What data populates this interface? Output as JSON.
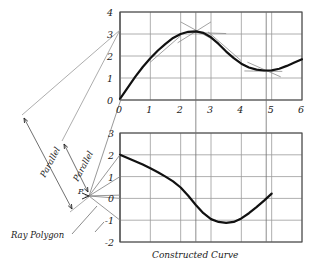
{
  "figure": {
    "caption": "Constructed Curve",
    "annotations": {
      "parallel_outer": "Parallel",
      "parallel_inner": "Parallel",
      "ray_polygon": "Ray Polygon",
      "pole": "P"
    }
  },
  "chart_data": [
    {
      "type": "line",
      "title": "",
      "id": "derivative-curve",
      "xlabel": "",
      "ylabel": "",
      "xlim": [
        0,
        6
      ],
      "ylim": [
        0,
        4
      ],
      "grid": true,
      "xticks": [
        "0",
        "1",
        "2",
        "3",
        "4",
        "5",
        "6"
      ],
      "yticks": [
        "0",
        "1",
        "2",
        "3",
        "4"
      ],
      "x": [
        0,
        0.25,
        0.5,
        0.75,
        1,
        1.25,
        1.5,
        1.75,
        2,
        2.25,
        2.5,
        2.75,
        3,
        3.25,
        3.5,
        3.75,
        4,
        4.25,
        4.5,
        4.75,
        5,
        5.25,
        5.5,
        5.75,
        6
      ],
      "values": [
        0.05,
        0.55,
        1.05,
        1.5,
        1.9,
        2.25,
        2.55,
        2.82,
        3.0,
        3.1,
        3.12,
        3.05,
        2.85,
        2.55,
        2.2,
        1.9,
        1.65,
        1.48,
        1.38,
        1.34,
        1.35,
        1.42,
        1.55,
        1.7,
        1.85
      ],
      "tangent_segments": [
        {
          "x0": 1.0,
          "y0": 1.72,
          "x1": 2.0,
          "y1": 2.92
        },
        {
          "x0": 1.9,
          "y0": 2.6,
          "x1": 3.0,
          "y1": 3.55
        },
        {
          "x0": 2.0,
          "y0": 3.55,
          "x1": 3.1,
          "y1": 2.72
        },
        {
          "x0": 2.2,
          "y0": 3.08,
          "x1": 3.5,
          "y1": 3.02
        },
        {
          "x0": 2.9,
          "y0": 3.1,
          "x1": 4.0,
          "y1": 1.78
        },
        {
          "x0": 4.1,
          "y0": 1.32,
          "x1": 5.35,
          "y1": 1.3
        },
        {
          "x0": 4.2,
          "y0": 1.72,
          "x1": 5.3,
          "y1": 1.05
        }
      ]
    },
    {
      "type": "line",
      "title": "",
      "id": "constructed-curve",
      "xlabel": "",
      "ylabel": "",
      "xlim": [
        0,
        6
      ],
      "ylim": [
        -2,
        3
      ],
      "grid": true,
      "xticks": [],
      "yticks": [
        "3",
        "2",
        "1",
        "0",
        "-1",
        "-2"
      ],
      "x": [
        0,
        0.25,
        0.5,
        0.75,
        1,
        1.25,
        1.5,
        1.75,
        2,
        2.25,
        2.5,
        2.75,
        3,
        3.25,
        3.5,
        3.75,
        4,
        4.25,
        4.5,
        4.75,
        5
      ],
      "values": [
        2.0,
        1.85,
        1.7,
        1.55,
        1.38,
        1.2,
        1.0,
        0.78,
        0.5,
        0.12,
        -0.3,
        -0.68,
        -0.95,
        -1.08,
        -1.12,
        -1.08,
        -0.92,
        -0.68,
        -0.4,
        -0.1,
        0.22
      ]
    }
  ],
  "ray_diagram": {
    "pole_label": "P",
    "rays": 5,
    "dimension_labels": [
      "Parallel",
      "Parallel"
    ]
  }
}
